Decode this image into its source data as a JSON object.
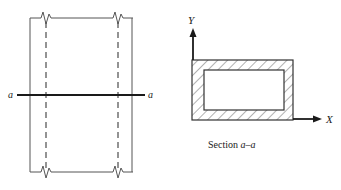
{
  "figure": {
    "background_color": "#ffffff",
    "line_color": "#555555",
    "heavy_line_color": "#1a1a1a",
    "hatch_color": "#666666"
  },
  "elevation_view": {
    "name": "beam-elevation",
    "section_line": {
      "left_label": "a",
      "right_label": "a"
    },
    "outer_edges": {
      "left_x": 30,
      "right_x": 132,
      "top_y": 18,
      "bottom_y": 172
    },
    "hidden_edges": {
      "left_x": 46,
      "right_x": 118
    },
    "break_symbols": 4
  },
  "section_view": {
    "name": "section-a-a",
    "caption_prefix": "Section ",
    "caption_label_left": "a",
    "caption_dash": "–",
    "caption_label_right": "a",
    "axis_y_label": "Y",
    "axis_x_label": "X",
    "outer_rect": {
      "x": 192,
      "y": 60,
      "width": 101,
      "height": 60
    },
    "inner_rect": {
      "x": 204,
      "y": 70,
      "width": 80,
      "height": 40
    },
    "hatch_angle_degrees": 45
  }
}
